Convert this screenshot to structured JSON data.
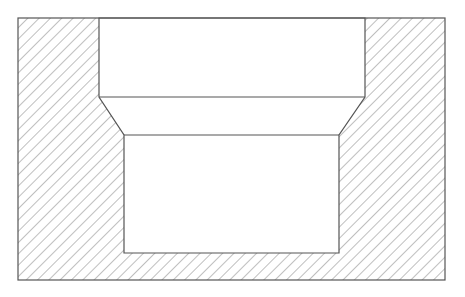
{
  "diagram": {
    "type": "sectional-view",
    "colors": {
      "background": "#ffffff",
      "outline": "#555555",
      "hatch": "#8a8a8a"
    },
    "hatch": {
      "angle_deg": 45,
      "spacing_px": 8
    },
    "outer_rect": {
      "x": 18,
      "y": 18,
      "width": 427,
      "height": 262
    },
    "cavity_polygon": [
      [
        99,
        18
      ],
      [
        365,
        18
      ],
      [
        365,
        97
      ],
      [
        339,
        135
      ],
      [
        339,
        253
      ],
      [
        124,
        253
      ],
      [
        124,
        135
      ],
      [
        99,
        97
      ]
    ],
    "step_line": {
      "x1": 99,
      "y1": 97,
      "x2": 365,
      "y2": 97
    },
    "lower_step_line": {
      "x1": 124,
      "y1": 135,
      "x2": 339,
      "y2": 135
    }
  }
}
